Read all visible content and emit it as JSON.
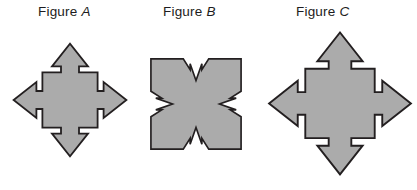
{
  "canvas": {
    "width": 417,
    "height": 190,
    "background_color": "#ffffff"
  },
  "style": {
    "shape_fill": "#ababab",
    "shape_stroke": "#231f20",
    "stroke_width": 1.6,
    "label_color": "#1c1c20"
  },
  "labels": {
    "figure_a": {
      "word": "Figure",
      "letter": "A",
      "full": "Figure A"
    },
    "figure_b": {
      "word": "Figure",
      "letter": "B",
      "full": "Figure B"
    },
    "figure_c": {
      "word": "Figure",
      "letter": "C",
      "full": "Figure C"
    }
  },
  "figures": [
    {
      "id": "figure-a",
      "label": "Figure A",
      "description": "Gray diamond (square rotated 45 degrees) with four arrows protruding outward at top, bottom, left and right; each arrow has a triangular head and a narrower shaft joined to the body with stepped notches.",
      "arrow_count": 4,
      "arrow_directions": [
        "up",
        "right",
        "down",
        "left"
      ],
      "bounds": {
        "x": 13,
        "y": 45,
        "width": 114,
        "height": 123
      },
      "fill": "#ababab",
      "stroke": "#231f20"
    },
    {
      "id": "figure-b",
      "label": "Figure B",
      "description": "Gray square with four white arrow-shaped notches cut inward from the middle of each side, pointing toward the centre; the notches are the negative of the arrows in figures A and C.",
      "notch_count": 4,
      "notch_directions": [
        "top",
        "right",
        "bottom",
        "left"
      ],
      "bounds": {
        "x": 150,
        "y": 58,
        "width": 92,
        "height": 92
      },
      "fill": "#ababab",
      "stroke": "#231f20"
    },
    {
      "id": "figure-c",
      "label": "Figure C",
      "description": "Same four-arrow compass shape as Figure A but drawn at a larger scale; the lower arrow tip reaches the bottom edge of the image.",
      "arrow_count": 4,
      "arrow_directions": [
        "up",
        "right",
        "down",
        "left"
      ],
      "bounds": {
        "x": 268,
        "y": 33,
        "width": 145,
        "height": 153
      },
      "fill": "#ababab",
      "stroke": "#231f20",
      "same_shape_as": "figure-a"
    }
  ]
}
